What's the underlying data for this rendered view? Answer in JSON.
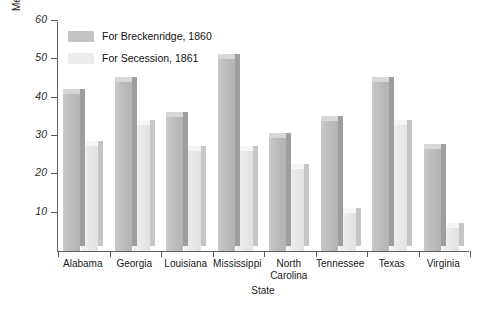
{
  "chart_data": {
    "type": "bar",
    "title": "",
    "xlabel": "State",
    "ylabel": "Median Percentage of Eligible Voters",
    "ylim": [
      0,
      60
    ],
    "yticks": [
      10,
      20,
      30,
      40,
      50,
      60
    ],
    "grid": false,
    "legend_position": "top-left",
    "categories": [
      "Alabama",
      "Georgia",
      "Louisiana",
      "Mississippi",
      "North\nCarolina",
      "Tennessee",
      "Texas",
      "Virginia"
    ],
    "series": [
      {
        "name": "For Breckenridge, 1860",
        "color": "#c4c4c4",
        "values": [
          41,
          44,
          35,
          50,
          29.5,
          34,
          44,
          26.5
        ]
      },
      {
        "name": "For Secession, 1861",
        "color": "#ececec",
        "values": [
          27.5,
          33,
          26,
          26,
          21.5,
          10,
          33,
          6
        ]
      }
    ]
  }
}
